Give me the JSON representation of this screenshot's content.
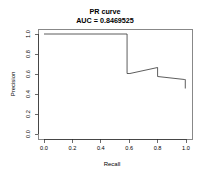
{
  "chart_data": {
    "type": "line",
    "title": "PR curve",
    "subtitle": "AUC = 0.8469525",
    "auc_label": "AUC = 0.8469525",
    "auc_value": 0.8469525,
    "xlabel": "Recall",
    "ylabel": "Precision",
    "xlim": [
      0.0,
      1.0
    ],
    "ylim": [
      0.0,
      1.0
    ],
    "grid": false,
    "legend": "none",
    "xticks": [
      "0.0",
      "0.2",
      "0.4",
      "0.6",
      "0.8",
      "1.0"
    ],
    "xtick_values": [
      0.0,
      0.2,
      0.4,
      0.6,
      0.8,
      1.0
    ],
    "yticks": [
      "0.0",
      "0.2",
      "0.4",
      "0.6",
      "0.8",
      "1.0"
    ],
    "ytick_values": [
      0.0,
      0.2,
      0.4,
      0.6,
      0.8,
      1.0
    ],
    "series": [
      {
        "name": "precision-recall",
        "x": [
          0.0,
          0.585,
          0.585,
          0.605,
          0.8,
          0.8,
          0.99,
          0.995,
          0.995
        ],
        "y": [
          1.0,
          1.0,
          0.605,
          0.605,
          0.665,
          0.575,
          0.545,
          0.545,
          0.455
        ]
      }
    ]
  },
  "axes": {
    "x_title": "Recall",
    "y_title": "Precision"
  }
}
